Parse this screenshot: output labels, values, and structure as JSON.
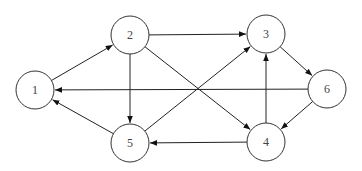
{
  "diagram": {
    "type": "directed-graph",
    "node_radius": 19,
    "colors": {
      "stroke": "#333333",
      "edge": "#222222",
      "label": "#444444",
      "background": "#ffffff"
    },
    "nodes": [
      {
        "id": "1",
        "label": "1",
        "x": 35,
        "y": 90
      },
      {
        "id": "2",
        "label": "2",
        "x": 130,
        "y": 35
      },
      {
        "id": "3",
        "label": "3",
        "x": 266,
        "y": 34
      },
      {
        "id": "4",
        "label": "4",
        "x": 266,
        "y": 142
      },
      {
        "id": "5",
        "label": "5",
        "x": 130,
        "y": 143
      },
      {
        "id": "6",
        "label": "6",
        "x": 327,
        "y": 89
      }
    ],
    "edges": [
      {
        "from": "1",
        "to": "2"
      },
      {
        "from": "2",
        "to": "3"
      },
      {
        "from": "2",
        "to": "4"
      },
      {
        "from": "2",
        "to": "5"
      },
      {
        "from": "3",
        "to": "6"
      },
      {
        "from": "4",
        "to": "3"
      },
      {
        "from": "4",
        "to": "5"
      },
      {
        "from": "5",
        "to": "1"
      },
      {
        "from": "5",
        "to": "3"
      },
      {
        "from": "6",
        "to": "1"
      },
      {
        "from": "6",
        "to": "4"
      }
    ]
  }
}
